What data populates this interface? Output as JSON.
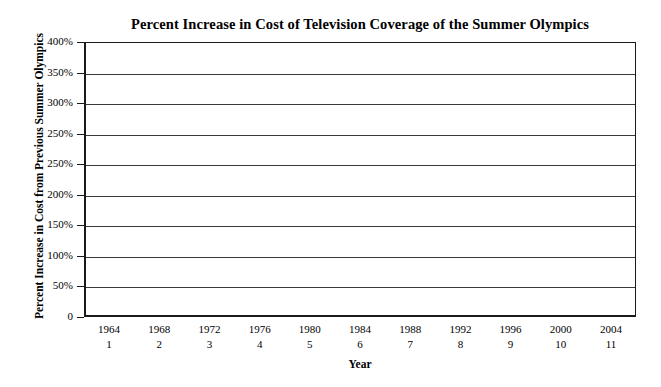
{
  "chart_data": {
    "type": "line",
    "title": "Percent Increase in Cost of Television Coverage of the Summer Olympics",
    "xlabel": "Year",
    "ylabel": "Percent Increase in Cost from Previous Summer Olympics",
    "grid": true,
    "legend": "none",
    "note_rendered": "Plot area contains only horizontal gridlines; no data series, markers, or bars are drawn in the figure.",
    "ylim": [
      0,
      400
    ],
    "ytick_labels": [
      "400%",
      "350%",
      "300%",
      "250%",
      "250%",
      "200%",
      "150%",
      "100%",
      "50%",
      "0"
    ],
    "ytick_values": [
      400,
      350,
      300,
      250,
      200,
      150,
      100,
      50,
      0
    ],
    "ytick_note": "As printed, the label '250%' appears twice (in the 300%/250% positions counting downward), reproducing an error in the source figure.",
    "categories": [
      "1964",
      "1968",
      "1972",
      "1976",
      "1980",
      "1984",
      "1988",
      "1992",
      "1996",
      "2000",
      "2004"
    ],
    "x_index_labels": [
      "1",
      "2",
      "3",
      "4",
      "5",
      "6",
      "7",
      "8",
      "9",
      "10",
      "11"
    ],
    "series": [
      {
        "name": "Percent increase in cost",
        "values": [
          null,
          null,
          null,
          null,
          null,
          null,
          null,
          null,
          null,
          null,
          null
        ]
      }
    ]
  },
  "axis": {
    "y_title": "Percent Increase in Cost from Previous Summer Olympics",
    "x_title": "Year"
  }
}
